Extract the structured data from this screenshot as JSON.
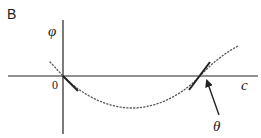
{
  "panel": {
    "label": "B"
  },
  "axes": {
    "y_label": "φ",
    "x_label": "c",
    "origin_label": "0"
  },
  "annotation": {
    "arrow_label": "θ"
  },
  "colors": {
    "line": "#222222",
    "curve": "#444444",
    "background": "#ffffff"
  }
}
